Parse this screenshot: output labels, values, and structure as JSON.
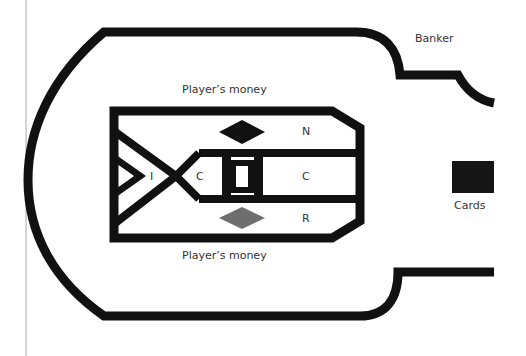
{
  "diagram": {
    "labels": {
      "banker": "Banker",
      "cards": "Cards",
      "player_money_top": "Player’s money",
      "player_money_bottom": "Player’s money"
    },
    "cells": {
      "n": "N",
      "c_right": "C",
      "r": "R",
      "c_left": "C",
      "i": "I"
    },
    "colors": {
      "stroke": "#111111",
      "dark_diamond": "#111111",
      "grey_diamond": "#6e6e6e",
      "cards_box": "#151515",
      "text": "#333333",
      "margin_line": "#aaaaaa"
    }
  }
}
